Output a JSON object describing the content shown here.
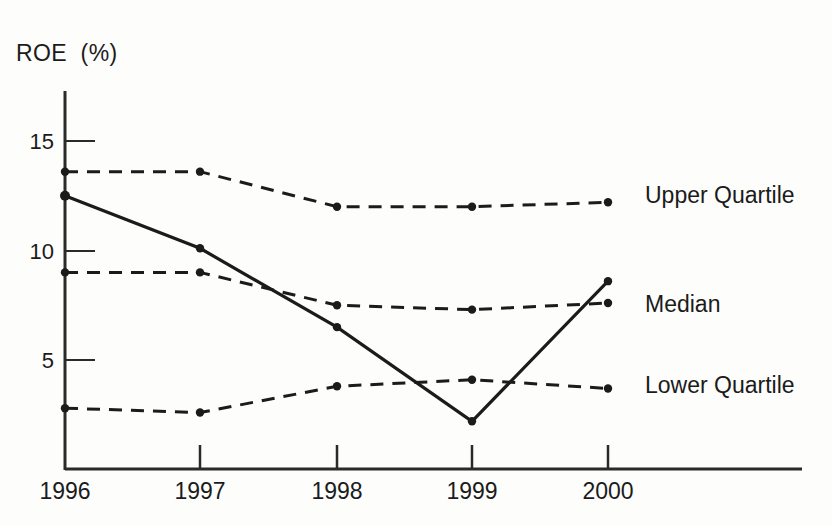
{
  "chart_data": {
    "type": "line",
    "title": "",
    "ylabel": "ROE  (%)",
    "xlabel": "",
    "categories": [
      "1996",
      "1997",
      "1998",
      "1999",
      "2000"
    ],
    "ylim": [
      0,
      16.5
    ],
    "yticks": [
      5,
      10,
      15
    ],
    "ytick_labels": [
      "5",
      "10",
      "15"
    ],
    "grid": false,
    "legend_position": "right-inline",
    "series": [
      {
        "name": "Upper Quartile",
        "style": "dashed",
        "markers": true,
        "values": [
          13.6,
          13.6,
          12.0,
          12.0,
          12.2
        ]
      },
      {
        "name": "Solid",
        "style": "solid",
        "markers": true,
        "values": [
          12.5,
          10.1,
          6.5,
          2.2,
          8.6
        ]
      },
      {
        "name": "Median",
        "style": "dashed",
        "markers": true,
        "values": [
          9.0,
          9.0,
          7.5,
          7.3,
          7.6
        ]
      },
      {
        "name": "Lower Quartile",
        "style": "dashed",
        "markers": true,
        "values": [
          2.8,
          2.6,
          3.8,
          4.1,
          3.7
        ]
      }
    ]
  },
  "axis_title": "ROE  (%)",
  "ytick_labels": [
    "15",
    "10",
    "5"
  ],
  "xtick_labels": [
    "1996",
    "1997",
    "1998",
    "1999",
    "2000"
  ],
  "series_labels": {
    "upper": "Upper Quartile",
    "median": "Median",
    "lower": "Lower Quartile"
  },
  "colors": {
    "ink": "#1b1b1b",
    "background": "#fdfdfc"
  }
}
